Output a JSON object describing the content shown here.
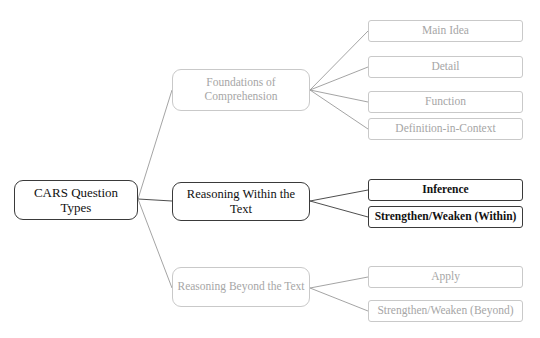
{
  "diagram": {
    "title": "CARS Question Types",
    "type": "tree-map",
    "background": "#ffffff",
    "colors": {
      "dark_text": "#111111",
      "dark_border": "#3a3a3a",
      "grey_text": "#a6a6a6",
      "grey_border": "#c9c9c9",
      "edge_line": "#9a9a9a"
    },
    "root": {
      "label": "CARS Question Types",
      "tone": "dark"
    },
    "branches": [
      {
        "label": "Foundations of Comprehension",
        "tone": "grey",
        "leaves": [
          {
            "label": "Main Idea",
            "tone": "grey"
          },
          {
            "label": "Detail",
            "tone": "grey"
          },
          {
            "label": "Function",
            "tone": "grey"
          },
          {
            "label": "Definition-in-Context",
            "tone": "grey"
          }
        ]
      },
      {
        "label": "Reasoning Within the Text",
        "tone": "dark",
        "leaves": [
          {
            "label": "Inference",
            "tone": "dark-bold"
          },
          {
            "label": "Strengthen/Weaken (Within)",
            "tone": "dark-bold"
          }
        ]
      },
      {
        "label": "Reasoning Beyond the Text",
        "tone": "grey",
        "leaves": [
          {
            "label": "Apply",
            "tone": "grey"
          },
          {
            "label": "Strengthen/Weaken (Beyond)",
            "tone": "grey"
          }
        ]
      }
    ],
    "flat_nodes": {
      "mid_0": "Foundations of Comprehension",
      "mid_1": "Reasoning Within the Text",
      "mid_2": "Reasoning Beyond the Text",
      "leaf_0": "Main Idea",
      "leaf_1": "Detail",
      "leaf_2": "Function",
      "leaf_3": "Definition-in-Context",
      "leaf_4": "Inference",
      "leaf_5": "Strengthen/Weaken (Within)",
      "leaf_6": "Apply",
      "leaf_7": "Strengthen/Weaken (Beyond)"
    }
  }
}
